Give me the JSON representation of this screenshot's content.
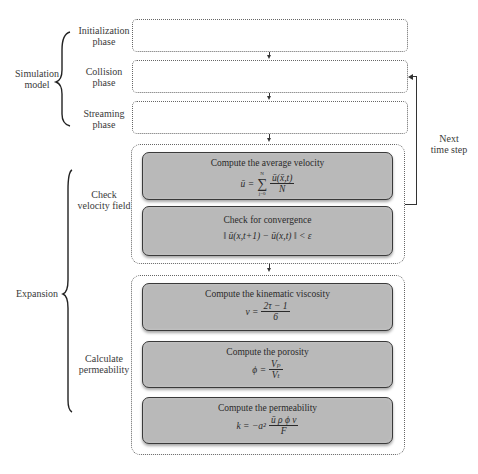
{
  "left_groups": [
    {
      "label_line1": "Simulation",
      "label_line2": "model"
    },
    {
      "label_line1": "Expansion",
      "label_line2": ""
    }
  ],
  "phases": [
    {
      "line1": "Initialization",
      "line2": "phase"
    },
    {
      "line1": "Collision",
      "line2": "phase"
    },
    {
      "line1": "Streaming",
      "line2": "phase"
    }
  ],
  "sub_labels": [
    {
      "line1": "Check",
      "line2": "velocity field"
    },
    {
      "line1": "Calculate",
      "line2": "permeability"
    }
  ],
  "loop": {
    "line1": "Next",
    "line2": "time step"
  },
  "steps": [
    {
      "title": "Compute the average velocity",
      "formula_lhs": "ū =",
      "sum_top": "N",
      "sum_bottom": "j=0",
      "num": "ū(x̄,t)",
      "den": "N"
    },
    {
      "title": "Check for convergence",
      "formula": "‖ ū(x,t+1) − ū(x,t) ‖ < ε"
    },
    {
      "title": "Compute the kinematic viscosity",
      "formula_lhs": "ν =",
      "num": "2τ − 1",
      "den": "6"
    },
    {
      "title": "Compute the porosity",
      "formula_lhs": "ϕ =",
      "num": "Vₚ",
      "den": "Vₜ"
    },
    {
      "title": "Compute the permeability",
      "formula_lhs": "k = −a²",
      "num": "ū ρ ϕ ν",
      "den": "F"
    }
  ],
  "colors": {
    "step_fill": "#b9b9b9",
    "step_border": "#3a3a3a",
    "dotted_border": "#666666"
  }
}
